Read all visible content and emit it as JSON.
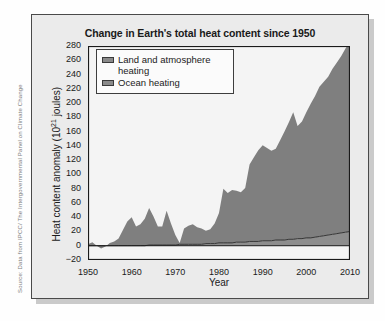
{
  "source_credit": "Source: Data from IPCC/ The Intergovernmental Panel on Climate Change",
  "legend": {
    "items": [
      {
        "label": "Land and atmosphere heating",
        "color": "#8a8a8a"
      },
      {
        "label": "Ocean heating",
        "color": "#8a8a8a"
      }
    ]
  },
  "colors": {
    "ocean_fill": "#7f7f7f",
    "land_fill": "#8d8d8d",
    "axis": "#1a1a1a",
    "plot_background": "#f4f4f4",
    "card_background": "#ebebeb",
    "card_border": "#4a4a4a"
  },
  "chart_data": {
    "type": "area",
    "title": "Change in Earth's total heat content since 1950",
    "xlabel": "Year",
    "ylabel": "Heat content anomaly (10^21 joules)",
    "ylabel_base": "Heat content anomaly (10",
    "ylabel_exp": "21",
    "ylabel_tail": " joules)",
    "xlim": [
      1950,
      2010
    ],
    "ylim": [
      -20,
      280
    ],
    "xticks": [
      1950,
      1960,
      1970,
      1980,
      1990,
      2000,
      2010
    ],
    "yticks": [
      -20,
      0,
      20,
      40,
      60,
      80,
      100,
      120,
      140,
      160,
      180,
      200,
      220,
      240,
      260,
      280
    ],
    "minor_x_interval": 1,
    "grid": false,
    "legend_position": "upper-left-inside",
    "stacked": true,
    "x": [
      1950,
      1951,
      1952,
      1953,
      1954,
      1955,
      1956,
      1957,
      1958,
      1959,
      1960,
      1961,
      1962,
      1963,
      1964,
      1965,
      1966,
      1967,
      1968,
      1969,
      1970,
      1971,
      1972,
      1973,
      1974,
      1975,
      1976,
      1977,
      1978,
      1979,
      1980,
      1981,
      1982,
      1983,
      1984,
      1985,
      1986,
      1987,
      1988,
      1989,
      1990,
      1991,
      1992,
      1993,
      1994,
      1995,
      1996,
      1997,
      1998,
      1999,
      2000,
      2001,
      2002,
      2003,
      2004,
      2005,
      2006,
      2007,
      2008,
      2009,
      2010
    ],
    "series": [
      {
        "name": "Land and atmosphere heating",
        "values": [
          0,
          0,
          0,
          0,
          0,
          0,
          0,
          0,
          0,
          0,
          0,
          0,
          0,
          0,
          1,
          1,
          1,
          1,
          1,
          1,
          1,
          2,
          2,
          2,
          2,
          2,
          2,
          3,
          3,
          3,
          4,
          4,
          4,
          4,
          5,
          5,
          5,
          6,
          6,
          6,
          7,
          7,
          7,
          8,
          8,
          8,
          9,
          9,
          10,
          10,
          11,
          11,
          12,
          13,
          14,
          15,
          16,
          17,
          18,
          19,
          20
        ]
      },
      {
        "name": "Ocean heating",
        "values": [
          2,
          5,
          0,
          -4,
          -1,
          4,
          6,
          10,
          22,
          34,
          40,
          27,
          30,
          38,
          52,
          40,
          26,
          26,
          48,
          30,
          14,
          2,
          22,
          26,
          28,
          24,
          22,
          18,
          20,
          28,
          42,
          76,
          70,
          74,
          72,
          70,
          76,
          108,
          118,
          128,
          134,
          130,
          126,
          128,
          140,
          152,
          164,
          178,
          158,
          164,
          176,
          188,
          198,
          210,
          216,
          222,
          232,
          240,
          248,
          258,
          265
        ]
      }
    ]
  }
}
